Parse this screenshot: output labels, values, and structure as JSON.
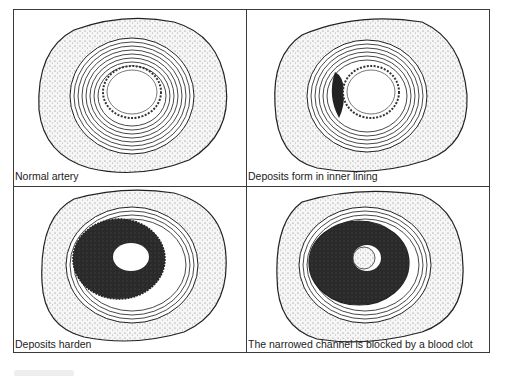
{
  "figure": {
    "panels": [
      {
        "id": "normal",
        "caption": "Normal artery",
        "stage": 1,
        "deposit": "none",
        "lumen": "open"
      },
      {
        "id": "deposits-form",
        "caption": "Deposits form in inner lining",
        "stage": 2,
        "deposit": "small crescent on inner left wall",
        "lumen": "open"
      },
      {
        "id": "deposits-harden",
        "caption": "Deposits harden",
        "stage": 3,
        "deposit": "thick dark plaque ring",
        "lumen": "narrowed"
      },
      {
        "id": "blocked",
        "caption": "The narrowed channel is blocked by a blood clot",
        "stage": 4,
        "deposit": "thick dark plaque ring",
        "lumen": "blocked by clot"
      }
    ],
    "colors": {
      "ink": "#222222",
      "plaque": "#2a2a2a",
      "tissue": "#f4f4f4",
      "frame": "#3a3a3a",
      "background": "#ffffff"
    }
  }
}
